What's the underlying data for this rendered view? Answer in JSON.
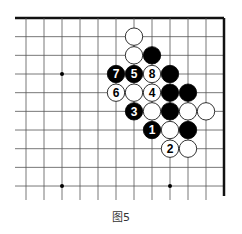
{
  "figure": {
    "caption": "图5",
    "board": {
      "columns": 12,
      "rows": 10,
      "edges": {
        "top": true,
        "right": true,
        "left": false,
        "bottom": false
      },
      "star_points": [
        {
          "col": 2,
          "row": 3
        },
        {
          "col": 2,
          "row": 9
        },
        {
          "col": 8,
          "row": 9
        }
      ],
      "colors": {
        "black": "#000000",
        "white": "#ffffff",
        "line": "#555555",
        "border": "#111111"
      }
    },
    "stones": [
      {
        "col": 6,
        "row": 1,
        "color": "white",
        "label": ""
      },
      {
        "col": 6,
        "row": 2,
        "color": "white",
        "label": ""
      },
      {
        "col": 7,
        "row": 2,
        "color": "black",
        "label": ""
      },
      {
        "col": 5,
        "row": 3,
        "color": "black",
        "label": "7"
      },
      {
        "col": 6,
        "row": 3,
        "color": "black",
        "label": "5"
      },
      {
        "col": 7,
        "row": 3,
        "color": "white",
        "label": "8"
      },
      {
        "col": 8,
        "row": 3,
        "color": "black",
        "label": ""
      },
      {
        "col": 5,
        "row": 4,
        "color": "white",
        "label": "6"
      },
      {
        "col": 6,
        "row": 4,
        "color": "white",
        "label": ""
      },
      {
        "col": 7,
        "row": 4,
        "color": "white",
        "label": "4"
      },
      {
        "col": 8,
        "row": 4,
        "color": "black",
        "label": ""
      },
      {
        "col": 9,
        "row": 4,
        "color": "black",
        "label": ""
      },
      {
        "col": 6,
        "row": 5,
        "color": "black",
        "label": "3"
      },
      {
        "col": 7,
        "row": 5,
        "color": "white",
        "label": ""
      },
      {
        "col": 8,
        "row": 5,
        "color": "black",
        "label": ""
      },
      {
        "col": 9,
        "row": 5,
        "color": "white",
        "label": ""
      },
      {
        "col": 10,
        "row": 5,
        "color": "white",
        "label": ""
      },
      {
        "col": 7,
        "row": 6,
        "color": "black",
        "label": "1"
      },
      {
        "col": 8,
        "row": 6,
        "color": "white",
        "label": ""
      },
      {
        "col": 9,
        "row": 6,
        "color": "black",
        "label": ""
      },
      {
        "col": 8,
        "row": 7,
        "color": "white",
        "label": "2"
      },
      {
        "col": 9,
        "row": 7,
        "color": "white",
        "label": ""
      }
    ]
  }
}
